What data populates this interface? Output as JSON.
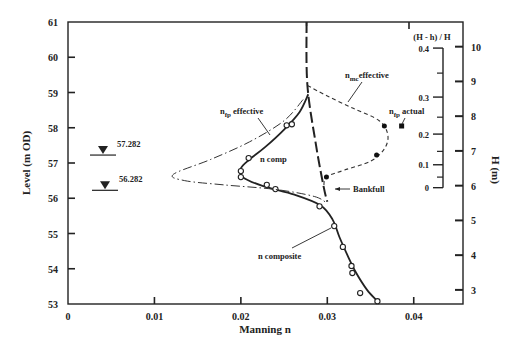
{
  "chart_data": {
    "type": "line",
    "title": "",
    "xlabel": "Manning n",
    "ylabel": "Level (m OD)",
    "ylabel_right": "H (m)",
    "ylabel_inner_right": "(H - h) / H",
    "xlim": [
      0,
      0.0457
    ],
    "ylim": [
      53,
      61
    ],
    "x_ticks": [
      0,
      0.01,
      0.02,
      0.03,
      0.04
    ],
    "x_tick_labels": [
      "0",
      "0.01",
      "0.02",
      "0.03",
      "0.04"
    ],
    "y_ticks": [
      53,
      54,
      55,
      56,
      57,
      58,
      59,
      60,
      61
    ],
    "y_tick_labels": [
      "53",
      "54",
      "55",
      "56",
      "57",
      "58",
      "59",
      "60",
      "61"
    ],
    "right_axis": {
      "label": "H (m)",
      "ticks": [
        3,
        4,
        5,
        6,
        7,
        8,
        9,
        10
      ],
      "tick_labels": [
        "3",
        "4",
        "5",
        "6",
        "7",
        "8",
        "9",
        "10"
      ],
      "level_at_H": [
        [
          3,
          53.4
        ],
        [
          10,
          60.3
        ]
      ]
    },
    "inner_right_axis": {
      "label": "(H - h) / H",
      "ticks": [
        0,
        0.1,
        0.2,
        0.3,
        0.4
      ],
      "tick_labels": [
        "0",
        "0.1",
        "0.2",
        "0.3",
        "0.4"
      ],
      "level_at_tick": [
        [
          0,
          56.3
        ],
        [
          0.1,
          56.95
        ],
        [
          0.2,
          57.82
        ],
        [
          0.3,
          58.87
        ],
        [
          0.4,
          60.26
        ]
      ],
      "minor_levels": [
        56.6,
        57.33,
        58.3,
        59.55
      ]
    },
    "grid": false,
    "legend": "none",
    "series": [
      {
        "name": "n composite",
        "style": "solid",
        "curve": [
          [
            0.0278,
            58.95
          ],
          [
            0.0268,
            58.45
          ],
          [
            0.025,
            57.95
          ],
          [
            0.0228,
            57.45
          ],
          [
            0.021,
            57.1
          ],
          [
            0.02,
            56.85
          ],
          [
            0.0202,
            56.6
          ],
          [
            0.0225,
            56.35
          ],
          [
            0.0262,
            56.1
          ],
          [
            0.0292,
            55.8
          ],
          [
            0.0306,
            55.4
          ],
          [
            0.0314,
            54.9
          ],
          [
            0.0323,
            54.4
          ],
          [
            0.0333,
            53.9
          ],
          [
            0.0346,
            53.4
          ],
          [
            0.0358,
            53.08
          ]
        ],
        "points": [
          [
            0.0253,
            58.07
          ],
          [
            0.0259,
            58.1
          ],
          [
            0.0209,
            57.14
          ],
          [
            0.02,
            56.77
          ],
          [
            0.02,
            56.6
          ],
          [
            0.023,
            56.38
          ],
          [
            0.024,
            56.26
          ],
          [
            0.0291,
            55.77
          ],
          [
            0.0308,
            55.21
          ],
          [
            0.0318,
            54.62
          ],
          [
            0.0328,
            54.08
          ],
          [
            0.0329,
            53.88
          ],
          [
            0.0338,
            53.31
          ],
          [
            0.0358,
            53.08
          ]
        ],
        "marker": "open-circle"
      },
      {
        "name": "n fp effective",
        "style": "dash-dot",
        "curve": [
          [
            0.0272,
            58.8
          ],
          [
            0.025,
            58.2
          ],
          [
            0.021,
            57.6
          ],
          [
            0.0165,
            57.1
          ],
          [
            0.0122,
            56.68
          ],
          [
            0.0135,
            56.5
          ],
          [
            0.018,
            56.38
          ],
          [
            0.024,
            56.25
          ],
          [
            0.0285,
            56.05
          ],
          [
            0.03,
            55.85
          ]
        ],
        "points": [],
        "marker": "none"
      },
      {
        "name": "n mc effective",
        "style": "dashed",
        "curve": [
          [
            0.0277,
            59.2
          ],
          [
            0.03,
            58.9
          ],
          [
            0.033,
            58.55
          ],
          [
            0.036,
            58.2
          ],
          [
            0.037,
            57.8
          ],
          [
            0.0366,
            57.4
          ],
          [
            0.035,
            57.05
          ],
          [
            0.032,
            56.8
          ],
          [
            0.0299,
            56.6
          ],
          [
            0.0296,
            56.3
          ]
        ],
        "points": [
          [
            0.0366,
            58.05
          ],
          [
            0.0357,
            57.23
          ],
          [
            0.0299,
            56.6
          ]
        ],
        "marker": "filled-circle"
      },
      {
        "name": "n fp actual",
        "style": "none",
        "curve": [],
        "points": [
          [
            0.0386,
            58.05
          ]
        ],
        "marker": "filled-square"
      },
      {
        "name": "main channel dashed",
        "style": "long-dash",
        "curve": [
          [
            0.0276,
            61.0
          ],
          [
            0.0277,
            59.2
          ],
          [
            0.0287,
            57.5
          ],
          [
            0.0296,
            56.3
          ],
          [
            0.03,
            55.9
          ]
        ],
        "points": [],
        "marker": "none"
      }
    ],
    "water_levels": [
      {
        "label": "57.282",
        "value": 57.282
      },
      {
        "label": "56.282",
        "value": 56.282
      }
    ],
    "annotations": [
      {
        "text": "n",
        "sub": "fp",
        "rest": " effective",
        "target": "n fp effective"
      },
      {
        "text": "n comp",
        "target": "n composite"
      },
      {
        "text": "n",
        "sub": "mc",
        "rest": "effective",
        "target": "n mc effective"
      },
      {
        "text": "n",
        "sub": "fp",
        "rest": " actual",
        "target": "n fp actual"
      },
      {
        "text": "Bankfull",
        "target": "bankfull"
      },
      {
        "text": "n composite",
        "target": "n composite"
      }
    ]
  }
}
